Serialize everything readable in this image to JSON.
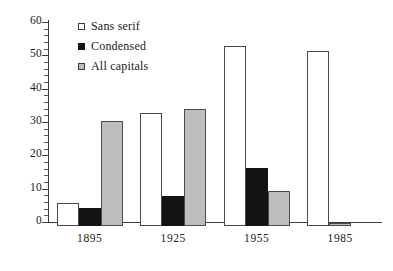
{
  "chart_data": {
    "type": "bar",
    "title": "",
    "subtitle": "",
    "xlabel": "",
    "ylabel": "",
    "categories": [
      "1895",
      "1925",
      "1955",
      "1985"
    ],
    "series": [
      {
        "name": "Sans serif",
        "values": [
          7,
          34,
          54,
          52.5
        ],
        "color": "#ffffff",
        "marker": "open-square"
      },
      {
        "name": "Condensed",
        "values": [
          5.5,
          9,
          17.5,
          0
        ],
        "color": "#121212",
        "marker": "filled-square"
      },
      {
        "name": "All capitals",
        "values": [
          31.5,
          35,
          10.5,
          1
        ],
        "color": "#bdbdbd",
        "marker": "gray-square"
      }
    ],
    "ylim": [
      0,
      60
    ],
    "ytick_labels": [
      "0",
      "10",
      "20",
      "30",
      "40",
      "50",
      "60"
    ],
    "ytick_values": [
      0,
      10,
      20,
      30,
      40,
      50,
      60
    ],
    "yminor_step": 2,
    "grid": false,
    "legend_position": "top-left-inside",
    "axis_style": "left-and-bottom-spines"
  },
  "legend": {
    "items": [
      {
        "label": "Sans serif"
      },
      {
        "label": "Condensed"
      },
      {
        "label": "All capitals"
      }
    ]
  }
}
